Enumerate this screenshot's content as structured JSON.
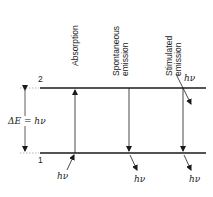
{
  "diagram": {
    "columns": [
      {
        "label_lines": [
          "Absorption"
        ],
        "x": 75,
        "direction": "up"
      },
      {
        "label_lines": [
          "Spontaneous",
          "emission"
        ],
        "x": 129,
        "direction": "down"
      },
      {
        "label_lines": [
          "Stimulated",
          "emission"
        ],
        "x": 183,
        "direction": "down"
      }
    ],
    "levels": {
      "upper_label": "2",
      "lower_label": "1",
      "upper_y": 88,
      "lower_y": 153
    },
    "energy_gap_label": "ΔE = hν",
    "photon_labels": {
      "absorption_in": "hν",
      "spontaneous_out": "hν",
      "stimulated_in": "hν",
      "stimulated_out": "hν"
    },
    "colors": {
      "line": "#1a1a1a",
      "text": "#222222"
    }
  }
}
